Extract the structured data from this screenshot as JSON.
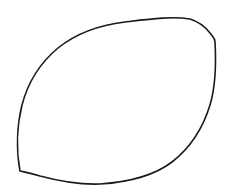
{
  "canvas": {
    "background": "#ffffff",
    "width": 227,
    "height": 195
  },
  "shape": {
    "kind": "hand-drawn leaf/lemon outline",
    "stroke": "#1a1a1a",
    "stroke_width": 1.6,
    "fill": "none",
    "path": "M 20 171 C 16 150, 17 125, 22 105 C 28 82, 40 63, 58 48 C 78 32, 100 25, 125 22 C 150 19, 172 16, 190 19 C 200 22, 206 28, 210 33 C 213 37, 215 38, 215 42 C 216 60, 216 85, 210 105 C 203 128, 190 148, 172 162 C 155 175, 130 182, 100 184 C 75 185, 55 180, 40 176 C 30 173, 24 172, 20 171 Z"
  }
}
